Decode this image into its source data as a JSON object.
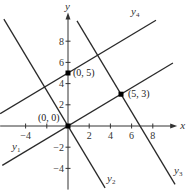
{
  "diagram": {
    "origin_px": [
      68,
      126
    ],
    "unit_px": 10.6,
    "axes": {
      "x_label": "x",
      "y_label": "y",
      "x_range": [
        -6.4,
        10.3
      ],
      "y_range": [
        -6,
        10.7
      ],
      "x_ticks": [
        {
          "value": -4,
          "label": "−4"
        },
        {
          "value": -2,
          "label": ""
        },
        {
          "value": 2,
          "label": "2"
        },
        {
          "value": 4,
          "label": "4"
        },
        {
          "value": 6,
          "label": "6"
        },
        {
          "value": 8,
          "label": "8"
        }
      ],
      "y_ticks": [
        {
          "value": 8,
          "label": "8"
        },
        {
          "value": 6,
          "label": "6"
        },
        {
          "value": 4,
          "label": "4"
        },
        {
          "value": 2,
          "label": "2"
        },
        {
          "value": -2,
          "label": "−2"
        },
        {
          "value": -4,
          "label": "−4"
        }
      ]
    },
    "lines": [
      {
        "name": "y1",
        "label": "y",
        "sub": "1",
        "slope": 0.6,
        "intercept": 0,
        "x_from": -6.2,
        "x_to": 9.9,
        "label_pos": [
          12,
          150
        ]
      },
      {
        "name": "y2",
        "label": "y",
        "sub": "2",
        "slope": -1.6667,
        "intercept": 0,
        "x_from": -6.05,
        "x_to": 3.5,
        "label_pos": [
          107,
          182
        ]
      },
      {
        "name": "y3",
        "label": "y",
        "sub": "3",
        "slope": -1.6667,
        "intercept": 11.3333,
        "x_from": 0.85,
        "x_to": 10.1,
        "label_pos": [
          174,
          174
        ]
      },
      {
        "name": "y4",
        "label": "y",
        "sub": "4",
        "slope": 0.6,
        "intercept": 5,
        "x_from": -6.4,
        "x_to": 8.3,
        "label_pos": [
          131,
          15
        ]
      }
    ],
    "points": [
      {
        "x": 0,
        "y": 0,
        "label": "(0, 0)",
        "label_pos": [
          38,
          121
        ]
      },
      {
        "x": 0,
        "y": 5,
        "label": "(0, 5)",
        "label_pos": [
          73,
          76
        ]
      },
      {
        "x": 5,
        "y": 3,
        "label": "(5, 3)",
        "label_pos": [
          128,
          97
        ]
      }
    ]
  }
}
